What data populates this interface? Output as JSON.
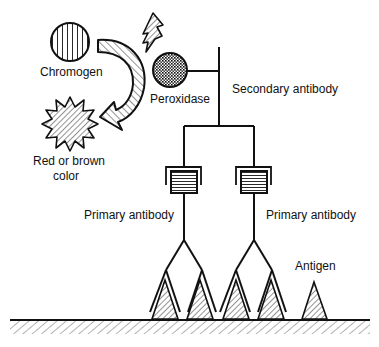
{
  "diagram": {
    "type": "immunohistochemistry-indirect-detection",
    "labels": {
      "chromogen": "Chromogen",
      "peroxidase": "Peroxidase",
      "secondary_antibody": "Secondary antibody",
      "red_brown_line1": "Red or brown",
      "red_brown_line2": "color",
      "primary_antibody_left": "Primary antibody",
      "primary_antibody_right": "Primary antibody",
      "antigen": "Antigen"
    },
    "colors": {
      "stroke": "#111111",
      "background": "#ffffff"
    }
  }
}
